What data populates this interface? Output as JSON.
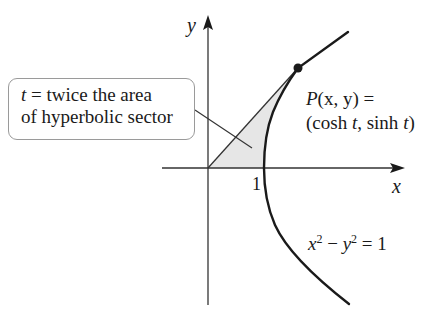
{
  "diagram": {
    "axes": {
      "x_label": "x",
      "y_label": "y",
      "tick_1_label": "1"
    },
    "curve": {
      "equation_lhs_x": "x",
      "equation_sup_1": "2",
      "equation_minus": " − ",
      "equation_lhs_y": "y",
      "equation_sup_2": "2",
      "equation_rhs": " = 1"
    },
    "point": {
      "name": "P",
      "coords_label": "(x, y) =",
      "param_label_open": "(cosh ",
      "param_t1": "t",
      "param_mid": ", sinh ",
      "param_t2": "t",
      "param_close": ")"
    },
    "callout": {
      "line1_var": "t",
      "line1_rest": " = twice the area",
      "line2": "of hyperbolic sector"
    },
    "colors": {
      "stroke": "#1a1a1a",
      "axis": "#333333",
      "sector_fill": "#e6e6e6",
      "callout_border": "#9a9a9a"
    }
  }
}
